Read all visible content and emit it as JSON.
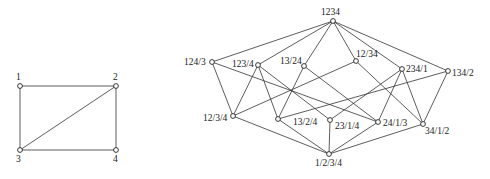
{
  "graph": {
    "nodes": [
      {
        "id": "1",
        "label": "1",
        "x": 20,
        "y": 86,
        "lx": 16,
        "ly": 80
      },
      {
        "id": "2",
        "label": "2",
        "x": 116,
        "y": 86,
        "lx": 113,
        "ly": 80
      },
      {
        "id": "3",
        "label": "3",
        "x": 20,
        "y": 150,
        "lx": 16,
        "ly": 162
      },
      {
        "id": "4",
        "label": "4",
        "x": 116,
        "y": 150,
        "lx": 113,
        "ly": 162
      }
    ],
    "edges": [
      [
        "1",
        "2"
      ],
      [
        "1",
        "3"
      ],
      [
        "2",
        "3"
      ],
      [
        "2",
        "4"
      ],
      [
        "3",
        "4"
      ]
    ]
  },
  "lattice": {
    "nodes": [
      {
        "id": "1234",
        "label": "1234",
        "x": 333,
        "y": 21,
        "lx": 321,
        "ly": 15
      },
      {
        "id": "124/3",
        "label": "124/3",
        "x": 212,
        "y": 62,
        "lx": 184,
        "ly": 65
      },
      {
        "id": "123/4",
        "label": "123/4",
        "x": 258,
        "y": 65,
        "lx": 232,
        "ly": 67
      },
      {
        "id": "13/24",
        "label": "13/24",
        "x": 304,
        "y": 66,
        "lx": 280,
        "ly": 64
      },
      {
        "id": "12/34",
        "label": "12/34",
        "x": 356,
        "y": 61,
        "lx": 356,
        "ly": 57
      },
      {
        "id": "234/1",
        "label": "234/1",
        "x": 402,
        "y": 69,
        "lx": 406,
        "ly": 72
      },
      {
        "id": "134/2",
        "label": "134/2",
        "x": 448,
        "y": 71,
        "lx": 452,
        "ly": 76
      },
      {
        "id": "12/3/4",
        "label": "12/3/4",
        "x": 233,
        "y": 116,
        "lx": 203,
        "ly": 121
      },
      {
        "id": "13/2/4",
        "label": "13/2/4",
        "x": 278,
        "y": 119,
        "lx": 293,
        "ly": 125
      },
      {
        "id": "23/1/4",
        "label": "23/1/4",
        "x": 330,
        "y": 120,
        "lx": 335,
        "ly": 129
      },
      {
        "id": "24/1/3",
        "label": "24/1/3",
        "x": 378,
        "y": 122,
        "lx": 383,
        "ly": 126
      },
      {
        "id": "34/1/2",
        "label": "34/1/2",
        "x": 423,
        "y": 124,
        "lx": 425,
        "ly": 134
      },
      {
        "id": "1/2/3/4",
        "label": "1/2/3/4",
        "x": 329,
        "y": 154,
        "lx": 315,
        "ly": 166
      }
    ],
    "edges": [
      [
        "1234",
        "124/3"
      ],
      [
        "1234",
        "123/4"
      ],
      [
        "1234",
        "13/24"
      ],
      [
        "1234",
        "12/34"
      ],
      [
        "1234",
        "234/1"
      ],
      [
        "1234",
        "134/2"
      ],
      [
        "124/3",
        "12/3/4"
      ],
      [
        "124/3",
        "24/1/3"
      ],
      [
        "123/4",
        "12/3/4"
      ],
      [
        "123/4",
        "13/2/4"
      ],
      [
        "123/4",
        "23/1/4"
      ],
      [
        "13/24",
        "13/2/4"
      ],
      [
        "13/24",
        "24/1/3"
      ],
      [
        "12/34",
        "12/3/4"
      ],
      [
        "12/34",
        "34/1/2"
      ],
      [
        "234/1",
        "23/1/4"
      ],
      [
        "234/1",
        "24/1/3"
      ],
      [
        "234/1",
        "34/1/2"
      ],
      [
        "134/2",
        "13/2/4"
      ],
      [
        "134/2",
        "34/1/2"
      ],
      [
        "12/3/4",
        "1/2/3/4"
      ],
      [
        "13/2/4",
        "1/2/3/4"
      ],
      [
        "23/1/4",
        "1/2/3/4"
      ],
      [
        "24/1/3",
        "1/2/3/4"
      ],
      [
        "34/1/2",
        "1/2/3/4"
      ]
    ]
  }
}
